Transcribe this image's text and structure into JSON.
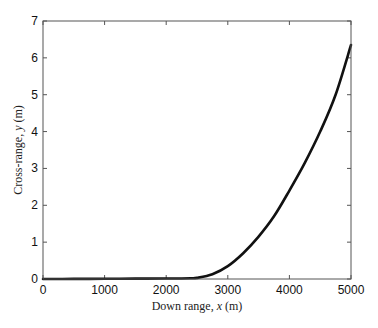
{
  "chart_data": {
    "type": "line",
    "title": "",
    "xlabel": "Down range, x (m)",
    "xlabel_parts": {
      "pre": "Down range, ",
      "var": "x",
      "post": " (m)"
    },
    "ylabel": "Cross-range, y (m)",
    "ylabel_parts": {
      "pre": "Cross-range, ",
      "var": "y",
      "post": " (m)"
    },
    "xlim": [
      0,
      5000
    ],
    "ylim": [
      0,
      7
    ],
    "xticks": [
      0,
      1000,
      2000,
      3000,
      4000,
      5000
    ],
    "yticks": [
      0,
      1,
      2,
      3,
      4,
      5,
      6,
      7
    ],
    "grid": false,
    "legend": null,
    "series": [
      {
        "name": "trajectory",
        "color": "#111111",
        "x": [
          0,
          500,
          1000,
          1500,
          2000,
          2250,
          2400,
          2500,
          2750,
          3000,
          3250,
          3500,
          3750,
          4000,
          4250,
          4500,
          4750,
          5000
        ],
        "y": [
          0,
          0.003,
          0.006,
          0.009,
          0.012,
          0.015,
          0.02,
          0.03,
          0.13,
          0.35,
          0.7,
          1.15,
          1.7,
          2.4,
          3.15,
          4.0,
          5.0,
          6.35
        ]
      }
    ]
  }
}
